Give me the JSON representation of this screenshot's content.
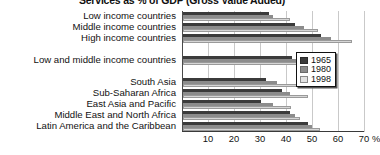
{
  "chart_data": {
    "type": "bar",
    "orientation": "horizontal",
    "title": "Services as % of GDP (Gross Value Added)",
    "xlabel": "",
    "ylabel": "",
    "xlim": [
      0,
      70
    ],
    "xticks": [
      10,
      20,
      30,
      40,
      50,
      60,
      70
    ],
    "xtick_labels": [
      "10",
      "20",
      "30",
      "40",
      "50",
      "60",
      "70"
    ],
    "x_unit": "%",
    "grid": true,
    "grid_axis": "x",
    "legend_position": "right",
    "categories": [
      "Low income countries",
      "Middle income countries",
      "High income countries",
      "",
      "Low and middle income countries",
      "",
      "South Asia",
      "Sub-Saharan Africa",
      "East Asia and Pacific",
      "Middle East and North Africa",
      "Latin America and the Caribbean"
    ],
    "series": [
      {
        "name": "1965",
        "color": "#3b3b3b",
        "values": [
          33.0,
          43.0,
          53.0,
          null,
          42.0,
          null,
          32.0,
          38.0,
          30.0,
          41.0,
          48.0
        ]
      },
      {
        "name": "1980",
        "color": "#8c8c8c",
        "values": [
          34.5,
          46.5,
          57.0,
          null,
          44.0,
          null,
          36.0,
          41.0,
          34.5,
          43.0,
          49.5
        ]
      },
      {
        "name": "1998",
        "color": "#d6d6d6",
        "values": [
          41.0,
          52.0,
          65.0,
          null,
          51.0,
          null,
          44.0,
          48.0,
          41.5,
          45.0,
          52.5
        ]
      }
    ]
  },
  "legend": {
    "entries": [
      {
        "label": "1965",
        "swatch": "s1965"
      },
      {
        "label": "1980",
        "swatch": "s1980"
      },
      {
        "label": "1998",
        "swatch": "s1998"
      }
    ]
  },
  "colors": {
    "series_1965": "#3b3b3b",
    "series_1980": "#8c8c8c",
    "series_1998": "#d6d6d6",
    "gridline": "#c9c9c9",
    "axis": "#3a3a3a",
    "text": "#111111",
    "background": "#ffffff"
  }
}
